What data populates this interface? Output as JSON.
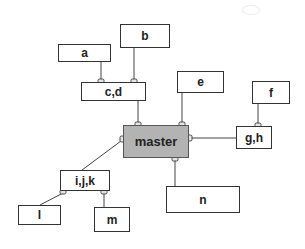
{
  "diagram": {
    "type": "entity-relationship / hierarchy",
    "nodes": [
      {
        "id": "a",
        "label": "a",
        "x": 58,
        "y": 44,
        "w": 53,
        "h": 18
      },
      {
        "id": "b",
        "label": "b",
        "x": 120,
        "y": 24,
        "w": 50,
        "h": 24
      },
      {
        "id": "cd",
        "label": "c,d",
        "x": 81,
        "y": 82,
        "w": 65,
        "h": 19
      },
      {
        "id": "e",
        "label": "e",
        "x": 177,
        "y": 71,
        "w": 47,
        "h": 22
      },
      {
        "id": "f",
        "label": "f",
        "x": 252,
        "y": 81,
        "w": 38,
        "h": 23
      },
      {
        "id": "gh",
        "label": "g,h",
        "x": 236,
        "y": 126,
        "w": 36,
        "h": 23
      },
      {
        "id": "master",
        "label": "master",
        "x": 123,
        "y": 125,
        "w": 66,
        "h": 33,
        "highlight": true
      },
      {
        "id": "ijk",
        "label": "i,j,k",
        "x": 60,
        "y": 170,
        "w": 50,
        "h": 21
      },
      {
        "id": "l",
        "label": "l",
        "x": 18,
        "y": 205,
        "w": 43,
        "h": 20
      },
      {
        "id": "m",
        "label": "m",
        "x": 94,
        "y": 207,
        "w": 36,
        "h": 25
      },
      {
        "id": "n",
        "label": "n",
        "x": 166,
        "y": 186,
        "w": 74,
        "h": 27
      }
    ],
    "edges": [
      {
        "from": "a",
        "to": "cd"
      },
      {
        "from": "b",
        "to": "cd"
      },
      {
        "from": "cd",
        "to": "master"
      },
      {
        "from": "e",
        "to": "master"
      },
      {
        "from": "f",
        "to": "gh"
      },
      {
        "from": "master",
        "to": "gh"
      },
      {
        "from": "master",
        "to": "ijk"
      },
      {
        "from": "master",
        "to": "n"
      },
      {
        "from": "ijk",
        "to": "l"
      },
      {
        "from": "ijk",
        "to": "m"
      }
    ],
    "colors": {
      "master_fill": "#b3b3b3",
      "box_fill": "#ffffff",
      "line": "#444444"
    }
  }
}
